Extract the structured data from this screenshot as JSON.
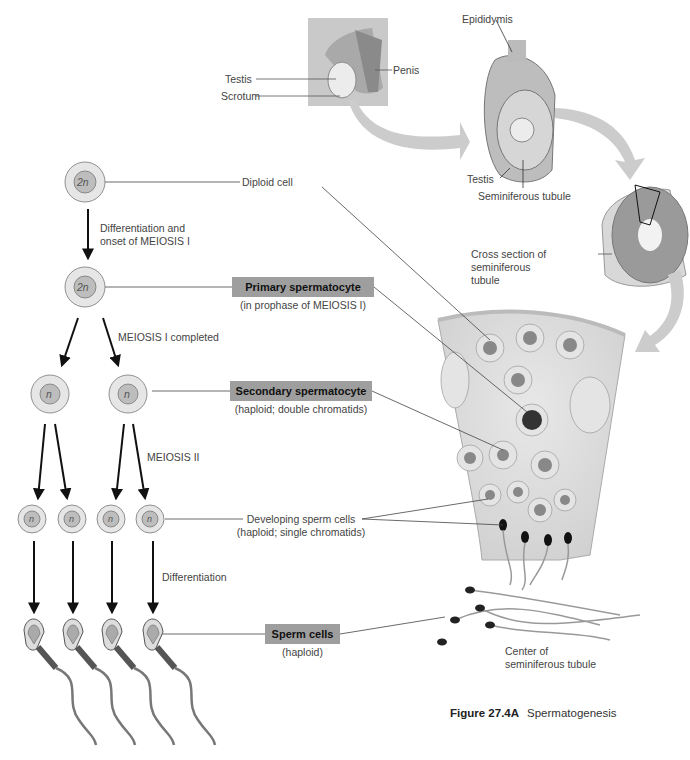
{
  "figure": {
    "number": "Figure 27.4A",
    "title": "Spermatogenesis"
  },
  "anatomy": {
    "inset_labels": [
      "Testis",
      "Scrotum",
      "Penis"
    ],
    "testis_labels": [
      "Epididymis",
      "Testis",
      "Seminiferous tubule"
    ],
    "cross_section_label": [
      "Cross section of",
      "seminiferous",
      "tubule"
    ],
    "center_label": [
      "Center of",
      "seminiferous tubule"
    ]
  },
  "cells": {
    "diploid": "2n",
    "haploid": "n"
  },
  "steps": {
    "step1": [
      "Differentiation and",
      "onset of MEIOSIS I"
    ],
    "step2": "MEIOSIS I completed",
    "step3": "MEIOSIS II",
    "step4": "Differentiation"
  },
  "stages": [
    {
      "name": "Diploid cell",
      "boxed": false,
      "detail": ""
    },
    {
      "name": "Primary spermatocyte",
      "boxed": true,
      "detail": "(in prophase of MEIOSIS I)"
    },
    {
      "name": "Secondary spermatocyte",
      "boxed": true,
      "detail": "(haploid; double chromatids)"
    },
    {
      "name": "Developing sperm cells",
      "boxed": false,
      "detail": "(haploid; single chromatids)"
    },
    {
      "name": "Sperm cells",
      "boxed": true,
      "detail": "(haploid)"
    }
  ],
  "colors": {
    "label_box": "#9e9e9e",
    "cell_outer": "#e6e6e6",
    "cell_inner": "#bdbdbd",
    "arrow_gray": "#c8c8c8"
  }
}
